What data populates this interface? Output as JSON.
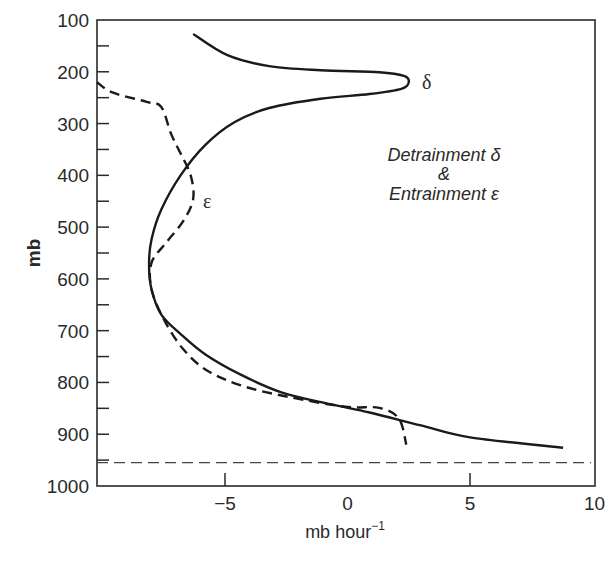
{
  "chart_data": {
    "type": "line",
    "title": "",
    "xlabel": "mb hour",
    "xlabel_superscript": "−1",
    "ylabel": "mb",
    "xlim": [
      -10.2,
      10.1
    ],
    "ylim": [
      1000,
      100
    ],
    "y_inverted": true,
    "grid": false,
    "x_ticks": [
      -5,
      0,
      5,
      10
    ],
    "x_tick_labels": [
      "−5",
      "0",
      "5",
      "10"
    ],
    "y_ticks": [
      100,
      200,
      300,
      400,
      500,
      600,
      700,
      800,
      900,
      1000
    ],
    "y_tick_labels": [
      "100",
      "200",
      "300",
      "400",
      "500",
      "600",
      "700",
      "800",
      "900",
      "1000"
    ],
    "y_minor_ticks": [
      150,
      250,
      350,
      450,
      550,
      650,
      750,
      850,
      950
    ],
    "annotation": {
      "line1": "Detrainment δ",
      "line2": "&",
      "line3": "Entrainment ε"
    },
    "curve_labels": {
      "detrainment": "δ",
      "entrainment": "ε"
    },
    "reference_line": {
      "style": "dashed",
      "pressure_mb": 955
    },
    "series": [
      {
        "name": "Detrainment δ",
        "style": "solid",
        "points": [
          [
            -6.3,
            127
          ],
          [
            -4.9,
            168
          ],
          [
            -3.2,
            189
          ],
          [
            -1.1,
            197
          ],
          [
            1.3,
            201
          ],
          [
            2.3,
            208
          ],
          [
            2.5,
            220
          ],
          [
            2.2,
            233
          ],
          [
            0.9,
            243
          ],
          [
            -1.1,
            252
          ],
          [
            -3.2,
            270
          ],
          [
            -4.6,
            297
          ],
          [
            -5.8,
            341
          ],
          [
            -6.8,
            399
          ],
          [
            -7.6,
            466
          ],
          [
            -8.0,
            524
          ],
          [
            -8.1,
            572
          ],
          [
            -8.0,
            620
          ],
          [
            -7.6,
            669
          ],
          [
            -6.8,
            707
          ],
          [
            -5.8,
            746
          ],
          [
            -4.4,
            784
          ],
          [
            -2.7,
            819
          ],
          [
            -0.7,
            842
          ],
          [
            0.9,
            858
          ],
          [
            3.0,
            883
          ],
          [
            5.0,
            906
          ],
          [
            8.8,
            926
          ]
        ]
      },
      {
        "name": "Entrainment ε",
        "style": "dashed",
        "points": [
          [
            -10.3,
            220
          ],
          [
            -9.6,
            240
          ],
          [
            -8.2,
            258
          ],
          [
            -7.6,
            268
          ],
          [
            -7.2,
            320
          ],
          [
            -6.8,
            359
          ],
          [
            -6.4,
            400
          ],
          [
            -6.3,
            446
          ],
          [
            -6.7,
            488
          ],
          [
            -7.4,
            530
          ],
          [
            -8.0,
            569
          ],
          [
            -8.0,
            620
          ],
          [
            -7.5,
            678
          ],
          [
            -6.7,
            736
          ],
          [
            -5.7,
            778
          ],
          [
            -4.2,
            808
          ],
          [
            -2.4,
            828
          ],
          [
            -0.1,
            847
          ],
          [
            1.3,
            849
          ],
          [
            2.1,
            870
          ],
          [
            2.4,
            920
          ]
        ]
      }
    ]
  }
}
